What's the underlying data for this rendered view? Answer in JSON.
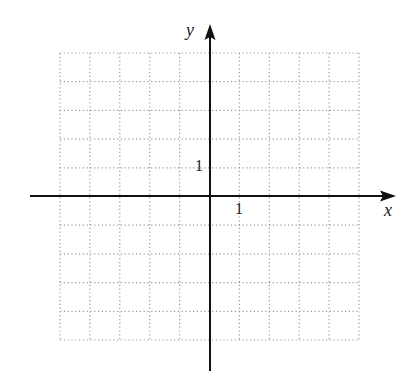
{
  "diagram": {
    "type": "coordinate-plane",
    "axes": {
      "x_label": "x",
      "y_label": "y",
      "x_tick_label": "1",
      "y_tick_label": "1"
    },
    "grid": {
      "style": "dotted",
      "columns": 10,
      "rows": 10,
      "x_range": [
        -5,
        5
      ],
      "y_range": [
        -5,
        5
      ],
      "color": "#9a9a9a"
    },
    "axis_color": "#111111"
  }
}
